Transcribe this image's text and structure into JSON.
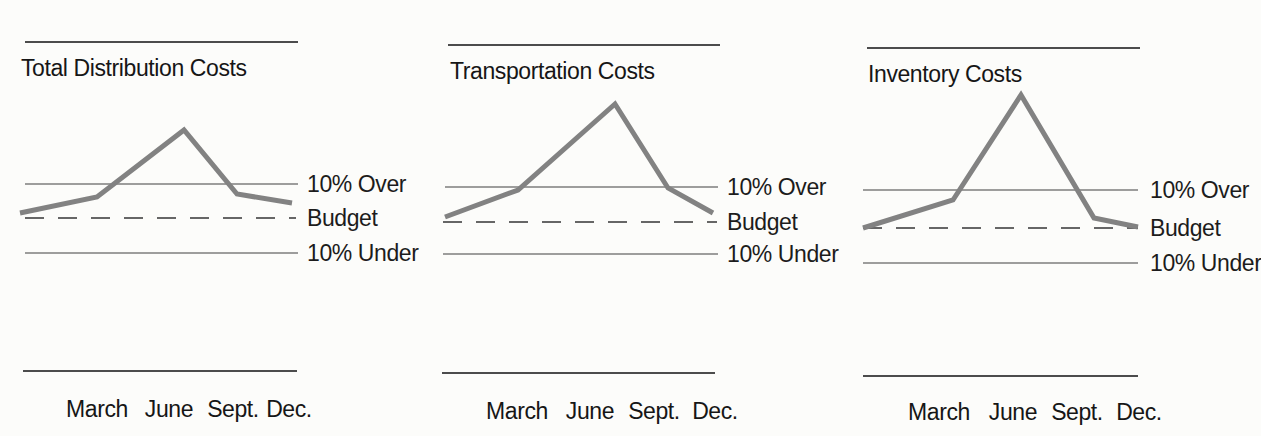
{
  "colors": {
    "background": "#fcfcfa",
    "text": "#161616",
    "rule_line": "#4c4c4c",
    "reference_line": "#3f3f3f",
    "budget_dashed_line": "#666666",
    "data_line_gray": "#828282"
  },
  "chart_data": [
    {
      "type": "line",
      "title": "Total Distribution Costs",
      "categories": [
        "March",
        "June",
        "Sept.",
        "Dec."
      ],
      "ref_lines": [
        {
          "label": "10% Over",
          "pct_vs_budget": 10,
          "style": "solid"
        },
        {
          "label": "Budget",
          "pct_vs_budget": 0,
          "style": "dashed"
        },
        {
          "label": "10% Under",
          "pct_vs_budget": -10,
          "style": "solid"
        }
      ],
      "series": [
        {
          "name": "Actual cost (% vs budget)",
          "values_pct_vs_budget": [
            6,
            26,
            7,
            4
          ],
          "lead_in_value_pct": 1.5
        }
      ],
      "xlabel": "",
      "ylabel": "",
      "grid": false,
      "legend": "none",
      "render": {
        "top_rule": {
          "x1": 25,
          "x2": 298,
          "y": 42
        },
        "bottom_rule": {
          "x1": 23,
          "x2": 297,
          "y": 371
        },
        "over_line": {
          "x1": 25,
          "x2": 298,
          "y": 184
        },
        "budget_line": {
          "x1": 25,
          "x2": 296,
          "y": 218
        },
        "under_line": {
          "x1": 25,
          "x2": 298,
          "y": 253
        },
        "polyline": [
          [
            20,
            213
          ],
          [
            97,
            197
          ],
          [
            184,
            130
          ],
          [
            237,
            194
          ],
          [
            292,
            203
          ]
        ]
      }
    },
    {
      "type": "line",
      "title": "Transportation Costs",
      "categories": [
        "March",
        "June",
        "Sept.",
        "Dec."
      ],
      "ref_lines": [
        {
          "label": "10% Over",
          "pct_vs_budget": 10,
          "style": "solid"
        },
        {
          "label": "Budget",
          "pct_vs_budget": 0,
          "style": "dashed"
        },
        {
          "label": "10% Under",
          "pct_vs_budget": -10,
          "style": "solid"
        }
      ],
      "series": [
        {
          "name": "Actual cost (% vs budget)",
          "values_pct_vs_budget": [
            9,
            34,
            10,
            3
          ],
          "lead_in_value_pct": 1.5
        }
      ],
      "xlabel": "",
      "ylabel": "",
      "grid": false,
      "legend": "none",
      "render": {
        "top_rule": {
          "x1": 28,
          "x2": 300,
          "y": 45
        },
        "bottom_rule": {
          "x1": 22,
          "x2": 295,
          "y": 373
        },
        "over_line": {
          "x1": 25,
          "x2": 298,
          "y": 187
        },
        "budget_line": {
          "x1": 23,
          "x2": 297,
          "y": 222
        },
        "under_line": {
          "x1": 23,
          "x2": 298,
          "y": 254
        },
        "polyline": [
          [
            25,
            217
          ],
          [
            98,
            190
          ],
          [
            195,
            104
          ],
          [
            248,
            188
          ],
          [
            293,
            213
          ]
        ]
      }
    },
    {
      "type": "line",
      "title": "Inventory Costs",
      "categories": [
        "March",
        "June",
        "Sept.",
        "Dec."
      ],
      "ref_lines": [
        {
          "label": "10% Over",
          "pct_vs_budget": 10,
          "style": "solid"
        },
        {
          "label": "Budget",
          "pct_vs_budget": 0,
          "style": "dashed"
        },
        {
          "label": "10% Under",
          "pct_vs_budget": -10,
          "style": "solid"
        }
      ],
      "series": [
        {
          "name": "Actual cost (% vs budget)",
          "values_pct_vs_budget": [
            7,
            35,
            3,
            0
          ],
          "lead_in_value_pct": 0
        }
      ],
      "xlabel": "",
      "ylabel": "",
      "grid": false,
      "legend": "none",
      "render": {
        "top_rule": {
          "x1": 27,
          "x2": 300,
          "y": 48
        },
        "bottom_rule": {
          "x1": 23,
          "x2": 298,
          "y": 376
        },
        "over_line": {
          "x1": 23,
          "x2": 298,
          "y": 190
        },
        "budget_line": {
          "x1": 23,
          "x2": 298,
          "y": 228
        },
        "under_line": {
          "x1": 23,
          "x2": 298,
          "y": 263
        },
        "polyline": [
          [
            23,
            228
          ],
          [
            113,
            200
          ],
          [
            181,
            95
          ],
          [
            254,
            218
          ],
          [
            298,
            227
          ]
        ]
      }
    }
  ]
}
